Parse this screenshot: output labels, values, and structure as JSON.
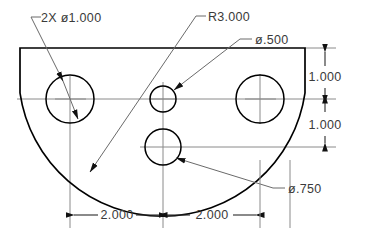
{
  "drawing": {
    "title": "Semicircular plate with four holes",
    "background_color": "#ffffff",
    "line_color": "#000000",
    "text_color": "#3a3a3a",
    "centerline_color": "#8a8a8a",
    "annotations": {
      "hole_2x_label": "2X  ø1.000",
      "radius_label": "R3.000",
      "hole_small_label": "ø.500",
      "hole_medium_label": "ø.750"
    },
    "dimensions": {
      "vertical_top": "1.000",
      "vertical_bottom": "1.000",
      "horizontal_left": "2.000",
      "horizontal_right": "2.000"
    },
    "features": {
      "outline_top_y": 48,
      "outline_left_x": 20,
      "outline_right_x": 305,
      "outline_bottom_y": 190,
      "arc_radius_label": "R3.000",
      "holes": [
        {
          "name": "left-hole",
          "cx": 70,
          "cy": 99,
          "r": 24,
          "label": "ø1.000"
        },
        {
          "name": "right-hole",
          "cx": 260,
          "cy": 99,
          "r": 24,
          "label": "ø1.000"
        },
        {
          "name": "center-small-hole",
          "cx": 163,
          "cy": 99,
          "r": 13,
          "label": "ø.500"
        },
        {
          "name": "center-lower-hole",
          "cx": 163,
          "cy": 147,
          "r": 18,
          "label": "ø.750"
        }
      ]
    }
  }
}
